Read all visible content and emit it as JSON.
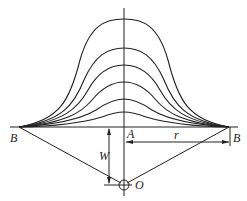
{
  "diagram": {
    "title": "",
    "labels": {
      "B_left": "B",
      "B_right": "B",
      "A": "A",
      "r": "r",
      "W": "W",
      "O": "O"
    },
    "geometry": {
      "axis_x": 124,
      "baseline_y": 127,
      "B_left_x": 19,
      "B_right_x": 229,
      "O_y": 185,
      "curve_peaks_y": [
        19,
        48,
        65,
        82,
        99,
        112
      ]
    }
  }
}
